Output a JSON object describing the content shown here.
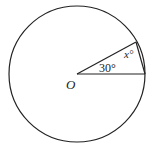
{
  "diagram": {
    "type": "circle-geometry",
    "center_label": "O",
    "angle_at_center_label": "30°",
    "unknown_angle_label": "x°",
    "elements": {
      "circle": {
        "cx": 77,
        "cy": 74,
        "r": 68
      },
      "radius_horizontal": {
        "from": "O",
        "to": "A"
      },
      "radius_slanted": {
        "from": "O",
        "to": "B"
      },
      "chord": {
        "from": "A",
        "to": "B"
      }
    },
    "stroke_color": "#222222"
  }
}
